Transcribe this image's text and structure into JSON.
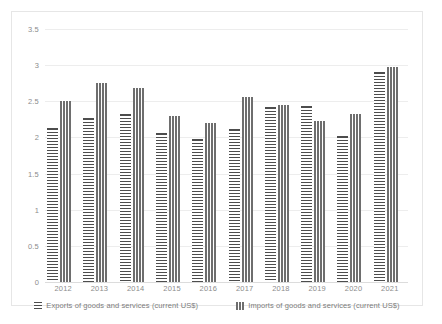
{
  "chart_data": {
    "type": "bar",
    "title": "",
    "subtitle": "",
    "xlabel": "",
    "ylabel": "",
    "categories": [
      "2012",
      "2013",
      "2014",
      "2015",
      "2016",
      "2017",
      "2018",
      "2019",
      "2020",
      "2021"
    ],
    "series": [
      {
        "name": "Exports of goods and services (current US$)",
        "pattern": "horizontal-stripes",
        "color": "#4d4d4d",
        "values": [
          2.13,
          2.27,
          2.33,
          2.06,
          1.98,
          2.11,
          2.42,
          2.43,
          2.02,
          2.9
        ]
      },
      {
        "name": "Imports of goods and services (current US$)",
        "pattern": "vertical-stripes",
        "color": "#6e6e6e",
        "values": [
          2.5,
          2.75,
          2.68,
          2.29,
          2.2,
          2.56,
          2.45,
          2.23,
          2.33,
          2.97
        ]
      }
    ],
    "ylim": [
      0,
      3.5
    ],
    "yticks": [
      "0",
      "0.5",
      "1",
      "1.5",
      "2",
      "2.5",
      "3",
      "3.5"
    ],
    "ytick_values": [
      0,
      0.5,
      1,
      1.5,
      2,
      2.5,
      3,
      3.5
    ],
    "grid": true,
    "legend_position": "bottom",
    "legend": [
      "Exports of goods and services (current US$)",
      "Imports of goods and services (current US$)"
    ]
  }
}
